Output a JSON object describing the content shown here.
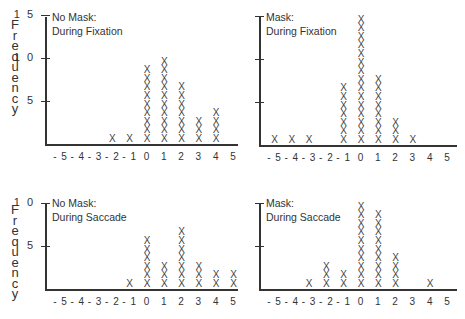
{
  "y_label": "Frequency",
  "x_ticks": [
    "-5",
    "-4",
    "-3",
    "-2",
    "-1",
    "0",
    "1",
    "2",
    "3",
    "4",
    "5"
  ],
  "mark_glyph": "X",
  "panels": [
    {
      "title_line1": "No Mask:",
      "title_line2": "During Fixation",
      "y_ticks": [
        {
          "value": 5,
          "label": "5"
        },
        {
          "value": 10,
          "label": "10"
        },
        {
          "value": 15,
          "label": "15"
        }
      ]
    },
    {
      "title_line1": "Mask:",
      "title_line2": "During Fixation",
      "y_ticks": [
        {
          "value": 5,
          "label": ""
        },
        {
          "value": 10,
          "label": ""
        },
        {
          "value": 15,
          "label": ""
        }
      ]
    },
    {
      "title_line1": "No Mask:",
      "title_line2": "During Saccade",
      "y_ticks": [
        {
          "value": 5,
          "label": "5"
        },
        {
          "value": 10,
          "label": "10"
        }
      ]
    },
    {
      "title_line1": "Mask:",
      "title_line2": "During Saccade",
      "y_ticks": [
        {
          "value": 5,
          "label": ""
        },
        {
          "value": 10,
          "label": ""
        }
      ]
    }
  ],
  "chart_data": [
    {
      "type": "bar",
      "title": "No Mask: During Fixation",
      "xlabel": "",
      "ylabel": "Frequency",
      "categories": [
        -5,
        -4,
        -3,
        -2,
        -1,
        0,
        1,
        2,
        3,
        4,
        5
      ],
      "values": [
        0,
        0,
        0,
        1,
        1,
        9,
        10,
        7,
        3,
        4,
        0
      ],
      "ylim": [
        0,
        15
      ],
      "yticks": [
        5,
        10,
        15
      ],
      "grid": false,
      "style": "dot-plot (X marks)"
    },
    {
      "type": "bar",
      "title": "Mask: During Fixation",
      "xlabel": "",
      "ylabel": "Frequency",
      "categories": [
        -5,
        -4,
        -3,
        -2,
        -1,
        0,
        1,
        2,
        3,
        4,
        5
      ],
      "values": [
        1,
        1,
        1,
        0,
        7,
        15,
        8,
        3,
        1,
        0,
        0
      ],
      "ylim": [
        0,
        15
      ],
      "yticks": [
        5,
        10,
        15
      ],
      "grid": false,
      "style": "dot-plot (X marks)"
    },
    {
      "type": "bar",
      "title": "No Mask: During Saccade",
      "xlabel": "",
      "ylabel": "Frequency",
      "categories": [
        -5,
        -4,
        -3,
        -2,
        -1,
        0,
        1,
        2,
        3,
        4,
        5
      ],
      "values": [
        0,
        0,
        0,
        0,
        1,
        6,
        3,
        7,
        3,
        2,
        2
      ],
      "ylim": [
        0,
        10
      ],
      "yticks": [
        5,
        10
      ],
      "grid": false,
      "style": "dot-plot (X marks)"
    },
    {
      "type": "bar",
      "title": "Mask: During Saccade",
      "xlabel": "",
      "ylabel": "Frequency",
      "categories": [
        -5,
        -4,
        -3,
        -2,
        -1,
        0,
        1,
        2,
        3,
        4,
        5
      ],
      "values": [
        0,
        0,
        1,
        3,
        2,
        10,
        9,
        4,
        0,
        1,
        0
      ],
      "ylim": [
        0,
        10
      ],
      "yticks": [
        5,
        10
      ],
      "grid": false,
      "style": "dot-plot (X marks)"
    }
  ]
}
